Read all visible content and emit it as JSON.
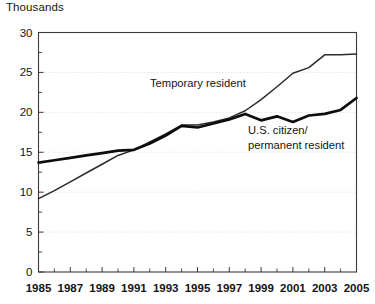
{
  "chart_data": {
    "type": "line",
    "title": "",
    "ylabel": "Thousands",
    "xlabel": "",
    "ylim": [
      0,
      30
    ],
    "xlim": [
      1985,
      2005
    ],
    "yticks": [
      0,
      5,
      10,
      15,
      20,
      25,
      30
    ],
    "ytick_labels": [
      "0",
      "5",
      "10",
      "15",
      "20",
      "25",
      "30"
    ],
    "gridlines": [
      5,
      10,
      15,
      20,
      25
    ],
    "grid": true,
    "grid_style": "dotted",
    "legend_position": "inline-annotation",
    "x": [
      1985,
      1986,
      1987,
      1988,
      1989,
      1990,
      1991,
      1992,
      1993,
      1994,
      1995,
      1996,
      1997,
      1998,
      1999,
      2000,
      2001,
      2002,
      2003,
      2004,
      2005
    ],
    "xtick_labels": [
      "1985",
      "1987",
      "1989",
      "1991",
      "1993",
      "1995",
      "1997",
      "1999",
      "2001",
      "2003",
      "2005"
    ],
    "xtick_label_years": [
      1985,
      1987,
      1989,
      1991,
      1993,
      1995,
      1997,
      1999,
      2001,
      2003,
      2005
    ],
    "series": [
      {
        "name": "Temporary resident",
        "label_lines": [
          "Temporary resident"
        ],
        "style": "thin",
        "color": "#2b2b2b",
        "values": [
          9.2,
          10.2,
          11.3,
          12.4,
          13.5,
          14.6,
          15.3,
          16.3,
          17.3,
          18.4,
          18.4,
          18.8,
          19.3,
          20.2,
          21.6,
          23.2,
          24.9,
          25.6,
          27.2,
          27.2,
          27.3
        ]
      },
      {
        "name": "U.S. citizen/permanent resident",
        "label_lines": [
          "U.S. citizen/",
          "permanent resident"
        ],
        "style": "thick",
        "color": "#0d0d0d",
        "values": [
          13.7,
          14.0,
          14.3,
          14.6,
          14.9,
          15.2,
          15.3,
          16.1,
          17.1,
          18.3,
          18.1,
          18.6,
          19.1,
          19.8,
          19.0,
          19.5,
          18.8,
          19.6,
          19.8,
          20.3,
          21.8
        ]
      }
    ],
    "annotations": [
      {
        "text": "Temporary resident",
        "lines": [
          "Temporary resident"
        ],
        "x_px": 150,
        "y_px": 87
      },
      {
        "text": "U.S. citizen/ permanent resident",
        "lines": [
          "U.S. citizen/",
          "permanent resident"
        ],
        "x_px": 248,
        "y_px": 134
      }
    ]
  }
}
